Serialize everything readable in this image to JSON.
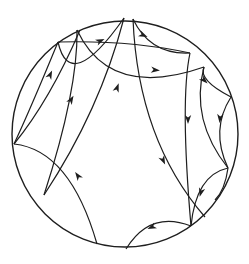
{
  "diagram": {
    "type": "poincare-disk-tiling",
    "colors": {
      "stroke": "#1e1e1e",
      "background": "#ffffff"
    },
    "disk": {
      "cx": 125,
      "cy": 134,
      "r": 113
    },
    "arcs": [
      "M 14 144 Q 30 110 58 42",
      "M 58 42 Q 70 95 124 18",
      "M 77 30 Q 78 90 44 195",
      "M 124 18 Q 100 110 44 195",
      "M 58 42 Q 130 40 190 53",
      "M 77 30 Q 110 100 204 67",
      "M 133 19 Q 150 55 190 53",
      "M 133 19 Q 138 140 205 217",
      "M 190 53 Q 180 100 191 226",
      "M 204 67 Q 198 80 231 97",
      "M 204 67 Q 190 120 228 168",
      "M 231 97 Q 210 130 228 168",
      "M 228 168 Q 196 175 191 226",
      "M 228 168 Q 225 190 215 200",
      "M 191 226 Q 150 210 126 249",
      "M 14 144 Q 70 150 97 244",
      "M 14 144 Q 50 100 80 30"
    ],
    "arrows": [
      {
        "x": 100,
        "y": 41,
        "angle": -25
      },
      {
        "x": 143,
        "y": 35,
        "angle": 25
      },
      {
        "x": 155,
        "y": 70,
        "angle": 5
      },
      {
        "x": 50,
        "y": 75,
        "angle": -65
      },
      {
        "x": 71,
        "y": 100,
        "angle": -60
      },
      {
        "x": 117,
        "y": 88,
        "angle": -70
      },
      {
        "x": 204,
        "y": 80,
        "angle": 45
      },
      {
        "x": 188,
        "y": 119,
        "angle": 90
      },
      {
        "x": 220,
        "y": 118,
        "angle": 95
      },
      {
        "x": 163,
        "y": 160,
        "angle": 65
      },
      {
        "x": 201,
        "y": 192,
        "angle": 105
      },
      {
        "x": 78,
        "y": 176,
        "angle": -125
      },
      {
        "x": 152,
        "y": 227,
        "angle": 155
      }
    ]
  }
}
